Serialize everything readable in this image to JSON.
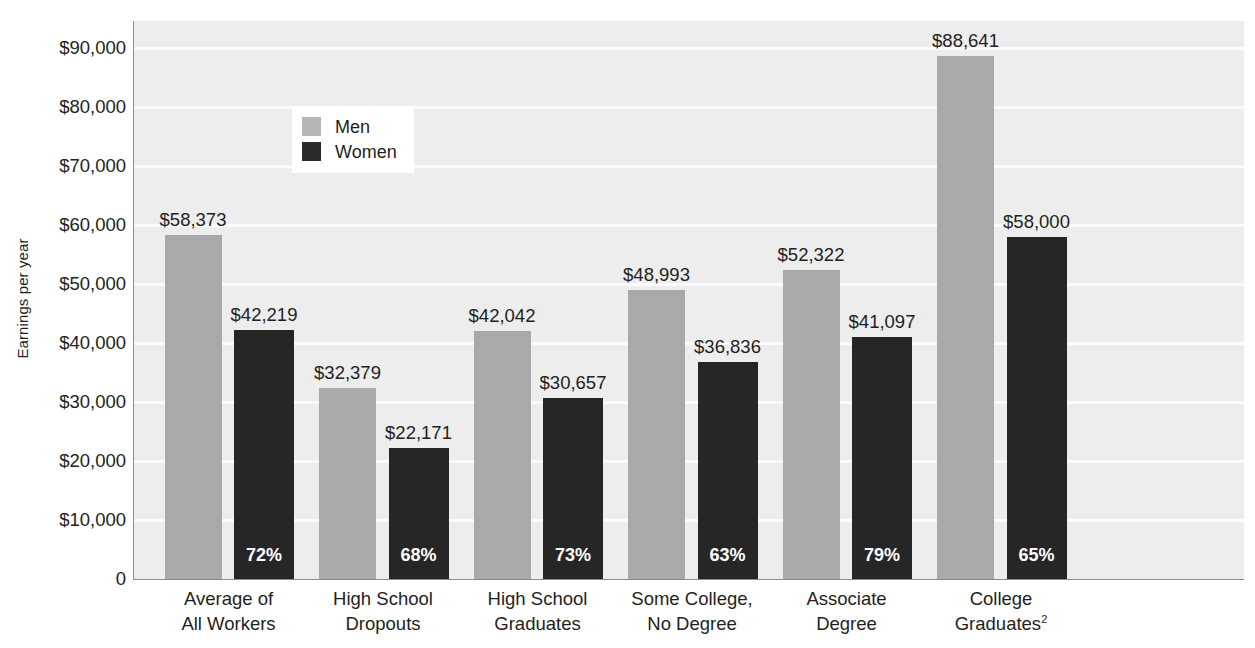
{
  "chart_data": {
    "type": "bar",
    "title": "",
    "xlabel": "",
    "ylabel": "Earnings per year",
    "ylim": [
      0,
      95000
    ],
    "yticks": [
      0,
      10000,
      20000,
      30000,
      40000,
      50000,
      60000,
      70000,
      80000,
      90000
    ],
    "ytick_labels": [
      "0",
      "$10,000",
      "$20,000",
      "$30,000",
      "$40,000",
      "$50,000",
      "$60,000",
      "$70,000",
      "$80,000",
      "$90,000"
    ],
    "grid": true,
    "legend_position": "upper-left-inside",
    "categories": [
      "Average of\nAll Workers",
      "High School\nDropouts",
      "High School\nGraduates",
      "Some College,\nNo Degree",
      "Associate\nDegree",
      "College\nGraduates2"
    ],
    "series": [
      {
        "name": "Men",
        "color": "#a9a9a9",
        "values": [
          58373,
          32379,
          42042,
          48993,
          52322,
          88641
        ],
        "labels": [
          "$58,373",
          "$32,379",
          "$42,042",
          "$48,993",
          "$52,322",
          "$88,641"
        ]
      },
      {
        "name": "Women",
        "color": "#262626",
        "values": [
          42219,
          22171,
          30657,
          36836,
          41097,
          58000
        ],
        "labels": [
          "$42,219",
          "$22,171",
          "$30,657",
          "$36,836",
          "$41,097",
          "$58,000"
        ],
        "in_bar_labels": [
          "72%",
          "68%",
          "73%",
          "63%",
          "79%",
          "65%"
        ]
      }
    ],
    "annotations": {
      "in_bar_note": "Percentages show women's earnings as a share of men's earnings in the same category."
    }
  },
  "axis": {
    "y_title": "Earnings per year",
    "ticks": [
      {
        "label": "$90,000",
        "value": 90000
      },
      {
        "label": "$80,000",
        "value": 80000
      },
      {
        "label": "$70,000",
        "value": 70000
      },
      {
        "label": "$60,000",
        "value": 60000
      },
      {
        "label": "$50,000",
        "value": 50000
      },
      {
        "label": "$40,000",
        "value": 40000
      },
      {
        "label": "$30,000",
        "value": 30000
      },
      {
        "label": "$20,000",
        "value": 20000
      },
      {
        "label": "$10,000",
        "value": 10000
      },
      {
        "label": "0",
        "value": 0
      }
    ]
  },
  "legend": {
    "items": [
      {
        "label": "Men",
        "color": "#b6b6b6"
      },
      {
        "label": "Women",
        "color": "#2b2b2b"
      }
    ]
  },
  "categories": [
    {
      "line1": "Average of",
      "line2": "All Workers",
      "sup": ""
    },
    {
      "line1": "High School",
      "line2": "Dropouts",
      "sup": ""
    },
    {
      "line1": "High School",
      "line2": "Graduates",
      "sup": ""
    },
    {
      "line1": "Some College,",
      "line2": "No Degree",
      "sup": ""
    },
    {
      "line1": "Associate",
      "line2": "Degree",
      "sup": ""
    },
    {
      "line1": "College",
      "line2": "Graduates",
      "sup": "2"
    }
  ],
  "colors": {
    "men_bar": "#a9a9a9",
    "women_bar": "#262626",
    "plot_background": "#ededed",
    "gridline": "#fbfbfb",
    "axis": "#8b8b8b",
    "text": "#231f20"
  }
}
